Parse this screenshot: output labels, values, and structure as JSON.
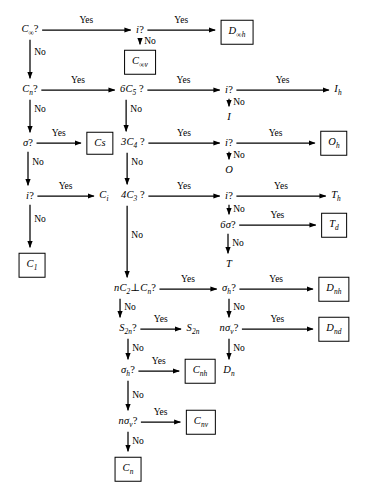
{
  "diagram": {
    "type": "decision-flowchart",
    "stroke_color": "#000000",
    "background_color": "#ffffff",
    "edge_labels": {
      "yes": "Yes",
      "no": "No"
    },
    "nodes": [
      {
        "id": "q_cinf",
        "text": "C∞?",
        "kind": "decision",
        "x": 30,
        "y": 30,
        "boxed": false
      },
      {
        "id": "q_i_1",
        "text": "i?",
        "kind": "decision",
        "x": 140,
        "y": 30,
        "boxed": false
      },
      {
        "id": "t_dinfh",
        "text": "D∞h",
        "kind": "terminal",
        "x": 237,
        "y": 32,
        "boxed": true
      },
      {
        "id": "t_cinfv",
        "text": "C∞v",
        "kind": "terminal",
        "x": 140,
        "y": 62,
        "boxed": true
      },
      {
        "id": "q_cn",
        "text": "Cn?",
        "kind": "decision",
        "x": 30,
        "y": 90,
        "boxed": false
      },
      {
        "id": "q_6c5",
        "text": "6C5 ?",
        "kind": "decision",
        "x": 132,
        "y": 90,
        "boxed": false
      },
      {
        "id": "q_i_2",
        "text": "i?",
        "kind": "decision",
        "x": 229,
        "y": 90,
        "boxed": false
      },
      {
        "id": "t_ih",
        "text": "Ih",
        "kind": "terminal",
        "x": 338,
        "y": 90,
        "boxed": false
      },
      {
        "id": "t_i",
        "text": "I",
        "kind": "terminal",
        "x": 229,
        "y": 117,
        "boxed": false
      },
      {
        "id": "q_sigma",
        "text": "σ?",
        "kind": "decision",
        "x": 28,
        "y": 143,
        "boxed": false
      },
      {
        "id": "t_cs",
        "text": "Cs",
        "kind": "terminal",
        "x": 100,
        "y": 143,
        "boxed": true
      },
      {
        "id": "q_3c4",
        "text": "3C4 ?",
        "kind": "decision",
        "x": 133,
        "y": 143,
        "boxed": false
      },
      {
        "id": "q_i_3",
        "text": "i?",
        "kind": "decision",
        "x": 229,
        "y": 143,
        "boxed": false
      },
      {
        "id": "t_oh",
        "text": "Oh",
        "kind": "terminal",
        "x": 334,
        "y": 143,
        "boxed": true
      },
      {
        "id": "t_o",
        "text": "O",
        "kind": "terminal",
        "x": 229,
        "y": 170,
        "boxed": false
      },
      {
        "id": "q_i_4",
        "text": "i?",
        "kind": "decision",
        "x": 30,
        "y": 196,
        "boxed": false
      },
      {
        "id": "t_ci",
        "text": "Ci",
        "kind": "terminal",
        "x": 104,
        "y": 196,
        "boxed": false
      },
      {
        "id": "q_4c3",
        "text": "4C3 ?",
        "kind": "decision",
        "x": 133,
        "y": 196,
        "boxed": false
      },
      {
        "id": "q_i_5",
        "text": "i?",
        "kind": "decision",
        "x": 229,
        "y": 196,
        "boxed": false
      },
      {
        "id": "t_th",
        "text": "Th",
        "kind": "terminal",
        "x": 336,
        "y": 196,
        "boxed": false
      },
      {
        "id": "q_6sigma",
        "text": "6σ?",
        "kind": "decision",
        "x": 228,
        "y": 225,
        "boxed": false
      },
      {
        "id": "t_td",
        "text": "Td",
        "kind": "terminal",
        "x": 334,
        "y": 225,
        "boxed": true
      },
      {
        "id": "t_t",
        "text": "T",
        "kind": "terminal",
        "x": 229,
        "y": 264,
        "boxed": false
      },
      {
        "id": "t_c1",
        "text": "C1",
        "kind": "terminal",
        "x": 32,
        "y": 265,
        "boxed": true
      },
      {
        "id": "q_nc2",
        "text": "nC2⊥Cn?",
        "kind": "decision",
        "x": 135,
        "y": 289,
        "boxed": false
      },
      {
        "id": "q_sigmah_1",
        "text": "σh?",
        "kind": "decision",
        "x": 229,
        "y": 289,
        "boxed": false
      },
      {
        "id": "t_dnh",
        "text": "Dnh",
        "kind": "terminal",
        "x": 334,
        "y": 289,
        "boxed": true
      },
      {
        "id": "q_s2n",
        "text": "S2n?",
        "kind": "decision",
        "x": 128,
        "y": 329,
        "boxed": false
      },
      {
        "id": "t_s2n",
        "text": "S2n",
        "kind": "terminal",
        "x": 193,
        "y": 329,
        "boxed": false
      },
      {
        "id": "q_nsigmav_1",
        "text": "nσv?",
        "kind": "decision",
        "x": 229,
        "y": 329,
        "boxed": false
      },
      {
        "id": "t_dnd",
        "text": "Dnd",
        "kind": "terminal",
        "x": 334,
        "y": 329,
        "boxed": true
      },
      {
        "id": "q_sigmah_2",
        "text": "σh?",
        "kind": "decision",
        "x": 128,
        "y": 371,
        "boxed": false
      },
      {
        "id": "t_cnh",
        "text": "Cnh",
        "kind": "terminal",
        "x": 200,
        "y": 371,
        "boxed": true
      },
      {
        "id": "t_dn",
        "text": "Dn",
        "kind": "terminal",
        "x": 229,
        "y": 371,
        "boxed": false
      },
      {
        "id": "q_nsigmav_2",
        "text": "nσv?",
        "kind": "decision",
        "x": 128,
        "y": 422,
        "boxed": false
      },
      {
        "id": "t_cnv",
        "text": "Cnv",
        "kind": "terminal",
        "x": 201,
        "y": 422,
        "boxed": true
      },
      {
        "id": "t_cn",
        "text": "Cn",
        "kind": "terminal",
        "x": 128,
        "y": 469,
        "boxed": true
      }
    ],
    "edges": [
      {
        "from": "q_cinf",
        "to": "q_i_1",
        "label": "Yes",
        "dir": "right"
      },
      {
        "from": "q_i_1",
        "to": "t_dinfh",
        "label": "Yes",
        "dir": "right"
      },
      {
        "from": "q_i_1",
        "to": "t_cinfv",
        "label": "No",
        "dir": "down"
      },
      {
        "from": "q_cinf",
        "to": "q_cn",
        "label": "No",
        "dir": "down"
      },
      {
        "from": "q_cn",
        "to": "q_6c5",
        "label": "Yes",
        "dir": "right"
      },
      {
        "from": "q_6c5",
        "to": "q_i_2",
        "label": "Yes",
        "dir": "right"
      },
      {
        "from": "q_i_2",
        "to": "t_ih",
        "label": "Yes",
        "dir": "right"
      },
      {
        "from": "q_i_2",
        "to": "t_i",
        "label": "No",
        "dir": "down"
      },
      {
        "from": "q_cn",
        "to": "q_sigma",
        "label": "No",
        "dir": "down"
      },
      {
        "from": "q_sigma",
        "to": "t_cs",
        "label": "Yes",
        "dir": "right"
      },
      {
        "from": "q_6c5",
        "to": "q_3c4",
        "label": "No",
        "dir": "down"
      },
      {
        "from": "q_3c4",
        "to": "q_i_3",
        "label": "Yes",
        "dir": "right"
      },
      {
        "from": "q_i_3",
        "to": "t_oh",
        "label": "Yes",
        "dir": "right"
      },
      {
        "from": "q_i_3",
        "to": "t_o",
        "label": "No",
        "dir": "down"
      },
      {
        "from": "q_sigma",
        "to": "q_i_4",
        "label": "No",
        "dir": "down"
      },
      {
        "from": "q_i_4",
        "to": "t_ci",
        "label": "Yes",
        "dir": "right"
      },
      {
        "from": "q_3c4",
        "to": "q_4c3",
        "label": "No",
        "dir": "down"
      },
      {
        "from": "q_4c3",
        "to": "q_i_5",
        "label": "Yes",
        "dir": "right"
      },
      {
        "from": "q_i_5",
        "to": "t_th",
        "label": "Yes",
        "dir": "right"
      },
      {
        "from": "q_i_5",
        "to": "q_6sigma",
        "label": "No",
        "dir": "down"
      },
      {
        "from": "q_6sigma",
        "to": "t_td",
        "label": "Yes",
        "dir": "right"
      },
      {
        "from": "q_6sigma",
        "to": "t_t",
        "label": "No",
        "dir": "down"
      },
      {
        "from": "q_i_4",
        "to": "t_c1",
        "label": "No",
        "dir": "down"
      },
      {
        "from": "q_4c3",
        "to": "q_nc2",
        "label": "No",
        "dir": "down"
      },
      {
        "from": "q_nc2",
        "to": "q_sigmah_1",
        "label": "Yes",
        "dir": "right"
      },
      {
        "from": "q_sigmah_1",
        "to": "t_dnh",
        "label": "Yes",
        "dir": "right"
      },
      {
        "from": "q_sigmah_1",
        "to": "q_nsigmav_1",
        "label": "No",
        "dir": "down"
      },
      {
        "from": "q_nsigmav_1",
        "to": "t_dnd",
        "label": "Yes",
        "dir": "right"
      },
      {
        "from": "q_nsigmav_1",
        "to": "t_dn",
        "label": "No",
        "dir": "down"
      },
      {
        "from": "q_nc2",
        "to": "q_s2n",
        "label": "No",
        "dir": "down"
      },
      {
        "from": "q_s2n",
        "to": "t_s2n",
        "label": "Yes",
        "dir": "right"
      },
      {
        "from": "q_s2n",
        "to": "q_sigmah_2",
        "label": "No",
        "dir": "down"
      },
      {
        "from": "q_sigmah_2",
        "to": "t_cnh",
        "label": "Yes",
        "dir": "right"
      },
      {
        "from": "q_sigmah_2",
        "to": "q_nsigmav_2",
        "label": "No",
        "dir": "down"
      },
      {
        "from": "q_nsigmav_2",
        "to": "t_cnv",
        "label": "Yes",
        "dir": "right"
      },
      {
        "from": "q_nsigmav_2",
        "to": "t_cn",
        "label": "No",
        "dir": "down"
      }
    ]
  }
}
